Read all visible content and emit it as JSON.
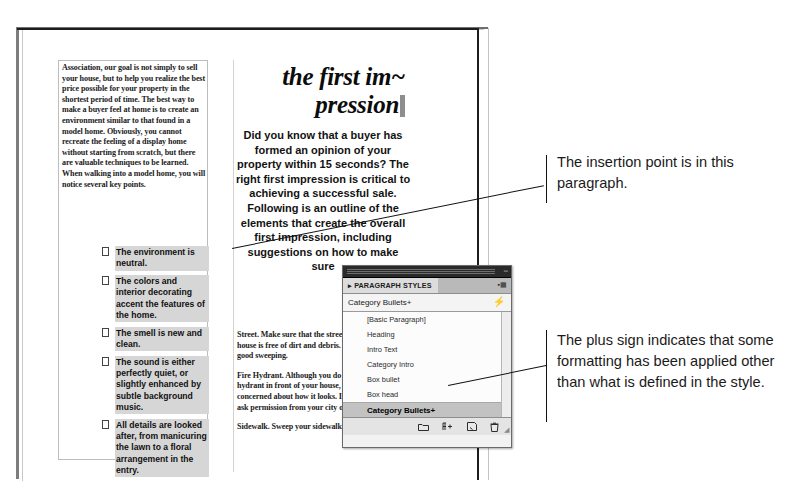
{
  "document": {
    "left_column_paragraph": "Association, our goal is not simply to sell your house, but to help you realize the best price possible for your property in the shortest period of time. The best way to make a buyer feel at home is to create an environment similar to that found in a model home. Obviously, you cannot recreate the feeling of a display home without starting from scratch, but there are valuable techniques to be learned. When walking into a model home, you will notice several key points.",
    "bullets": [
      "The environment is neutral.",
      "The colors and interior decorating accent the features of the home.",
      "The smell is new and clean.",
      "The sound is either perfectly quiet, or slightly enhanced by subtle background music.",
      "All details are looked after, from manicuring the lawn to a floral arrangement in the entry."
    ],
    "headline": "the first im~ pression",
    "intro_text": "Did you know that a buyer has formed an opinion of your property within 15 seconds? The right first impression is critical to achieving a successful sale. Following is an outline of the elements that create the overall first impression, including suggestions on how to make sure",
    "lower_paragraphs": [
      "Street. Make sure that the street in front of your house is free of dirt and debris. If necessary, give it a good sweeping.",
      "Fire Hydrant. Although you do not own the fire hydrant in front of your house, you should still be concerned about how it looks. If it needs painting, ask permission from your city or town.",
      "Sidewalk. Sweep your sidewalk if need-"
    ]
  },
  "annotations": [
    {
      "id": "insertion-point-note",
      "text": "The insertion point is in this paragraph."
    },
    {
      "id": "plus-sign-note",
      "text": "The plus sign indicates that some formatting has been applied other than what is defined in the style."
    }
  ],
  "panel": {
    "title": "PARAGRAPH STYLES",
    "title_prefix_icon": "chevron-right-icon",
    "tab_menu_icon": "panel-menu-icon",
    "current_style": "Category Bullets+",
    "clear_overrides_icon": "lightning-bolt-icon",
    "styles": [
      "[Basic Paragraph]",
      "Heading",
      "Intro Text",
      "Category Intro",
      "Box bullet",
      "Box head",
      "Category Bullets+"
    ],
    "selected_style": "Category Bullets+",
    "footer_icons": [
      "new-style-group-icon",
      "clear-overrides-icon",
      "new-style-icon",
      "delete-style-icon"
    ],
    "resize_grip_icon": "resize-grip-icon"
  },
  "colors": {
    "highlight_gray": "#d6d6d6",
    "panel_selected": "#c2c2c2",
    "panel_titlebar": "#2a2a2a",
    "text": "#1a1a1a"
  }
}
